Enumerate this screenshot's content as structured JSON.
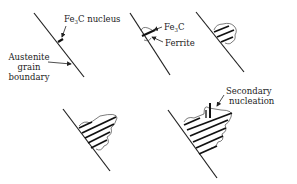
{
  "panels": [
    {
      "id": 1,
      "labels": {
        "fe3c_nucleus_prefix": "Fe",
        "fe3c_nucleus_sub": "3",
        "fe3c_nucleus_suffix": "C nucleus",
        "austenite_line1": "Austenite",
        "austenite_line2": "grain",
        "austenite_line3": "boundary"
      }
    },
    {
      "id": 2,
      "labels": {
        "fe3c_prefix": "Fe",
        "fe3c_sub": "3",
        "fe3c_suffix": "C",
        "ferrite": "Ferrite"
      }
    },
    {
      "id": 3,
      "labels": {}
    },
    {
      "id": 4,
      "labels": {}
    },
    {
      "id": 5,
      "labels": {
        "secondary_line1": "Secondary",
        "secondary_line2": "nucleation"
      }
    }
  ],
  "colors": {
    "ink": "#222222",
    "background": "#ffffff"
  }
}
